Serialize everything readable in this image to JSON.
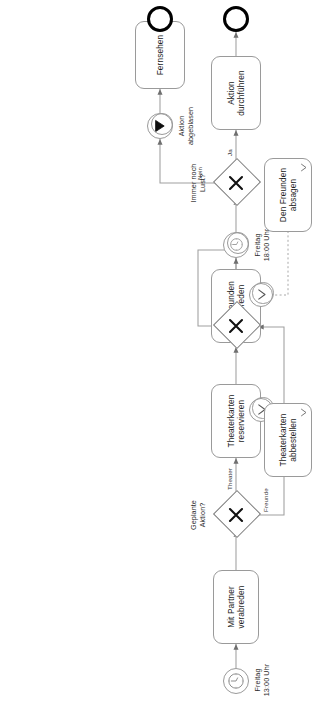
{
  "diagram": {
    "type": "bpmn-process",
    "orientation": "rotated-90-ccw",
    "colors": {
      "stroke": "#9a9a9a",
      "gateway_stroke": "#7a7a7a",
      "end_event_stroke": "#000000",
      "text": "#1a1a1a",
      "background": "#ffffff"
    },
    "events": [
      {
        "id": "start-timer",
        "kind": "start-timer",
        "icon": "clock-icon",
        "label": "Freitag\n13:00 Uhr"
      },
      {
        "id": "timer-1800",
        "kind": "intermediate-timer",
        "icon": "clock-icon",
        "label": "Freitag\n18:00 Uhr"
      },
      {
        "id": "escalation-throw",
        "kind": "intermediate-escalation-throw",
        "icon": "escalation-filled-icon",
        "label": "Aktion\nabgeblasen"
      },
      {
        "id": "end-aktion",
        "kind": "end",
        "icon": "end-event-icon",
        "label": ""
      },
      {
        "id": "end-fernsehen",
        "kind": "end",
        "icon": "end-event-icon",
        "label": ""
      },
      {
        "id": "bnd-theater",
        "kind": "boundary-escalation",
        "icon": "escalation-icon",
        "label": ""
      },
      {
        "id": "bnd-freunde",
        "kind": "boundary-escalation",
        "icon": "escalation-icon",
        "label": ""
      }
    ],
    "gateways": [
      {
        "id": "gw-geplante",
        "kind": "exclusive",
        "icon": "gateway-x-icon",
        "label": "Geplante\nAktion?"
      },
      {
        "id": "gw-join",
        "kind": "exclusive",
        "icon": "gateway-x-icon",
        "label": ""
      },
      {
        "id": "gw-lust",
        "kind": "exclusive",
        "icon": "gateway-x-icon",
        "label": "Immer noch\nLust?"
      }
    ],
    "tasks": [
      {
        "id": "t-partner",
        "label": "Mit Partner\nverabreden",
        "marker": "none"
      },
      {
        "id": "t-reserv",
        "label": "Theaterkarten\nreservieren",
        "marker": "none"
      },
      {
        "id": "t-abbest",
        "label": "Theaterkarten\nabbestellen",
        "marker": "escalation-icon"
      },
      {
        "id": "t-freunde",
        "label": "Mit Freunden\nverabreden",
        "marker": "none"
      },
      {
        "id": "t-absagen",
        "label": "Den Freunden\nabsagen",
        "marker": "escalation-icon"
      },
      {
        "id": "t-durchf",
        "label": "Aktion\ndurchführen",
        "marker": "none"
      },
      {
        "id": "t-fernsehen",
        "label": "Fernsehen",
        "marker": "none"
      }
    ],
    "flow_labels": [
      {
        "id": "fl-theater",
        "label": "Theater"
      },
      {
        "id": "fl-freunde",
        "label": "Freunde"
      },
      {
        "id": "fl-ja",
        "label": "Ja"
      },
      {
        "id": "fl-nein",
        "label": "Nein"
      }
    ]
  }
}
